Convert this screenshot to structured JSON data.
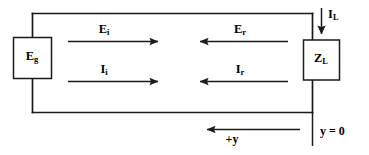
{
  "diagram": {
    "stroke_color": "#1a1a1a",
    "background_color": "#ffffff",
    "components": {
      "generator": {
        "label_main": "E",
        "label_sub": "g",
        "name": "generator-source"
      },
      "load": {
        "label_main": "Z",
        "label_sub": "L",
        "name": "load-impedance"
      }
    },
    "arrows": [
      {
        "id": "incident-voltage",
        "label_main": "E",
        "label_sub": "i",
        "direction": "right"
      },
      {
        "id": "incident-current",
        "label_main": "I",
        "label_sub": "i",
        "direction": "right"
      },
      {
        "id": "reflected-voltage",
        "label_main": "E",
        "label_sub": "r",
        "direction": "left"
      },
      {
        "id": "reflected-current",
        "label_main": "I",
        "label_sub": "r",
        "direction": "left"
      },
      {
        "id": "load-current",
        "label_main": "I",
        "label_sub": "L",
        "direction": "down"
      },
      {
        "id": "positive-y-axis",
        "label_main": "+y",
        "label_sub": "",
        "direction": "left"
      }
    ],
    "axis": {
      "origin_label": "y = 0"
    }
  }
}
